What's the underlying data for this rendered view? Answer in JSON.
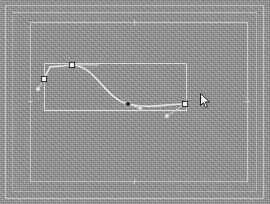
{
  "app": {
    "title": "Vector Path Editor Canvas",
    "canvas_color": "#919191",
    "frame_color": "#c2c2c2",
    "path_color": "#e6e6e6",
    "anchor_color": "#f2f2f2",
    "selected_anchor_color": "#2b2b2b",
    "bbox_color": "#dcdcdc"
  },
  "canvas": {
    "width": 270,
    "height": 204,
    "frames": [
      {
        "name": "outer-frame",
        "x": 5,
        "y": 5,
        "w": 259,
        "h": 194
      },
      {
        "name": "middle-frame",
        "x": 12,
        "y": 12,
        "w": 245,
        "h": 180
      },
      {
        "name": "page-frame",
        "x": 30,
        "y": 22,
        "w": 218,
        "h": 160
      }
    ],
    "guide_ticks": [
      {
        "name": "tick-top",
        "x": 134,
        "y": 20
      },
      {
        "name": "tick-bottom",
        "x": 134,
        "y": 179
      },
      {
        "name": "tick-left",
        "x": 28,
        "y": 101
      },
      {
        "name": "tick-right",
        "x": 245,
        "y": 101
      }
    ]
  },
  "selection": {
    "bounding_box": {
      "x": 44,
      "y": 63,
      "w": 143,
      "h": 48
    },
    "label": "selection-bounding-box"
  },
  "path": {
    "d": "M 44 79 L 50 67 L 72 65 C 95 65 105 99 128 104 C 152 109 165 104 185 104",
    "handle_lines": [
      {
        "x1": 44,
        "y1": 79,
        "x2": 38,
        "y2": 89
      },
      {
        "x1": 72,
        "y1": 65,
        "x2": 98,
        "y2": 65
      },
      {
        "x1": 128,
        "y1": 104,
        "x2": 140,
        "y2": 108
      },
      {
        "x1": 185,
        "y1": 104,
        "x2": 167,
        "y2": 116
      }
    ],
    "anchors": [
      {
        "name": "anchor-start",
        "x": 44,
        "y": 79,
        "selected": true
      },
      {
        "name": "anchor-top",
        "x": 72,
        "y": 65,
        "selected": true
      },
      {
        "name": "anchor-mid",
        "x": 128,
        "y": 104,
        "selected": false
      },
      {
        "name": "anchor-end",
        "x": 185,
        "y": 104,
        "selected": true
      }
    ],
    "control_points": [
      {
        "name": "control-point-1",
        "x": 38,
        "y": 89
      },
      {
        "name": "control-point-2",
        "x": 140,
        "y": 108
      },
      {
        "name": "control-point-3",
        "x": 167,
        "y": 116
      }
    ]
  },
  "cursor": {
    "name": "pointer-cursor",
    "x": 200,
    "y": 93,
    "type": "node-edit-arrow"
  }
}
